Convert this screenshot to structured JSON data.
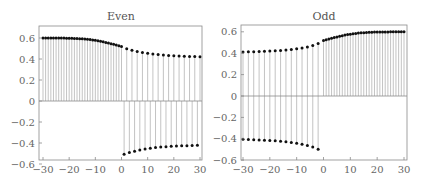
{
  "chart_data": [
    {
      "type": "stem",
      "title": "Even",
      "xlabel": "",
      "ylabel": "",
      "xlim": [
        -31.5,
        31
      ],
      "ylim": [
        -0.6,
        0.65
      ],
      "xticks": [
        -30,
        -20,
        -10,
        0,
        10,
        20,
        30
      ],
      "xtick_labels": [
        "−30",
        "−20",
        "−10",
        "0",
        "10",
        "20",
        "30"
      ],
      "yticks": [
        0.6,
        0.4,
        0.2,
        0,
        -0.2,
        -0.4,
        -0.6
      ],
      "ytick_labels": [
        "0.6",
        "0.4",
        "0.2",
        "0",
        "−0.2",
        "−0.4",
        "−0.6"
      ],
      "grid": false,
      "series": [
        {
          "name": "dense-positive",
          "x": [
            -30,
            -29,
            -28,
            -27,
            -26,
            -25,
            -24,
            -23,
            -22,
            -21,
            -20,
            -19,
            -18,
            -17,
            -16,
            -15,
            -14,
            -13,
            -12,
            -11,
            -10,
            -9,
            -8,
            -7,
            -6,
            -5,
            -4,
            -3,
            -2,
            -1,
            0
          ],
          "y": [
            0.6,
            0.6,
            0.6,
            0.6,
            0.6,
            0.6,
            0.599,
            0.599,
            0.599,
            0.598,
            0.598,
            0.597,
            0.596,
            0.595,
            0.594,
            0.592,
            0.59,
            0.588,
            0.585,
            0.582,
            0.578,
            0.574,
            0.569,
            0.564,
            0.558,
            0.552,
            0.546,
            0.54,
            0.533,
            0.526,
            0.519
          ]
        },
        {
          "name": "sparse-positive",
          "x": [
            2,
            4,
            6,
            8,
            10,
            12,
            14,
            16,
            18,
            20,
            22,
            24,
            26,
            28,
            30
          ],
          "y": [
            0.498,
            0.484,
            0.472,
            0.462,
            0.454,
            0.447,
            0.442,
            0.437,
            0.434,
            0.431,
            0.428,
            0.426,
            0.424,
            0.423,
            0.422
          ]
        },
        {
          "name": "sparse-negative",
          "x": [
            1,
            3,
            5,
            7,
            9,
            11,
            13,
            15,
            17,
            19,
            21,
            23,
            25,
            27,
            29
          ],
          "y": [
            -0.508,
            -0.491,
            -0.478,
            -0.467,
            -0.458,
            -0.45,
            -0.444,
            -0.439,
            -0.435,
            -0.432,
            -0.429,
            -0.427,
            -0.425,
            -0.423,
            -0.422
          ]
        }
      ]
    },
    {
      "type": "stem",
      "title": "Odd",
      "xlabel": "",
      "ylabel": "",
      "xlim": [
        -31.5,
        31
      ],
      "ylim": [
        -0.6,
        0.65
      ],
      "xticks": [
        -30,
        -20,
        -10,
        0,
        10,
        20,
        30
      ],
      "xtick_labels": [
        "−30",
        "−20",
        "−10",
        "0",
        "10",
        "20",
        "30"
      ],
      "yticks": [
        0.6,
        0.4,
        0.2,
        0,
        -0.2,
        -0.4,
        -0.6
      ],
      "ytick_labels": [
        "0.6",
        "0.4",
        "0.2",
        "0",
        "−0.2",
        "−0.4",
        "−0.6"
      ],
      "grid": false,
      "series": [
        {
          "name": "dense-positive",
          "x": [
            0,
            1,
            2,
            3,
            4,
            5,
            6,
            7,
            8,
            9,
            10,
            11,
            12,
            13,
            14,
            15,
            16,
            17,
            18,
            19,
            20,
            21,
            22,
            23,
            24,
            25,
            26,
            27,
            28,
            29,
            30
          ],
          "y": [
            0.519,
            0.526,
            0.533,
            0.54,
            0.546,
            0.552,
            0.558,
            0.564,
            0.569,
            0.574,
            0.578,
            0.582,
            0.585,
            0.588,
            0.59,
            0.592,
            0.594,
            0.595,
            0.596,
            0.597,
            0.598,
            0.598,
            0.599,
            0.599,
            0.599,
            0.6,
            0.6,
            0.6,
            0.6,
            0.6,
            0.6
          ]
        },
        {
          "name": "sparse-positive",
          "x": [
            -30,
            -28,
            -26,
            -24,
            -22,
            -20,
            -18,
            -16,
            -14,
            -12,
            -10,
            -8,
            -6,
            -4,
            -2
          ],
          "y": [
            0.412,
            0.413,
            0.414,
            0.416,
            0.418,
            0.42,
            0.423,
            0.426,
            0.43,
            0.435,
            0.441,
            0.449,
            0.459,
            0.472,
            0.49
          ]
        },
        {
          "name": "sparse-negative",
          "x": [
            -30,
            -28,
            -26,
            -24,
            -22,
            -20,
            -18,
            -16,
            -14,
            -12,
            -10,
            -8,
            -6,
            -4,
            -2
          ],
          "y": [
            -0.405,
            -0.407,
            -0.409,
            -0.411,
            -0.413,
            -0.416,
            -0.419,
            -0.423,
            -0.428,
            -0.434,
            -0.441,
            -0.45,
            -0.462,
            -0.477,
            -0.497
          ]
        }
      ]
    }
  ],
  "panels": [
    {
      "title": "Even"
    },
    {
      "title": "Odd"
    }
  ]
}
